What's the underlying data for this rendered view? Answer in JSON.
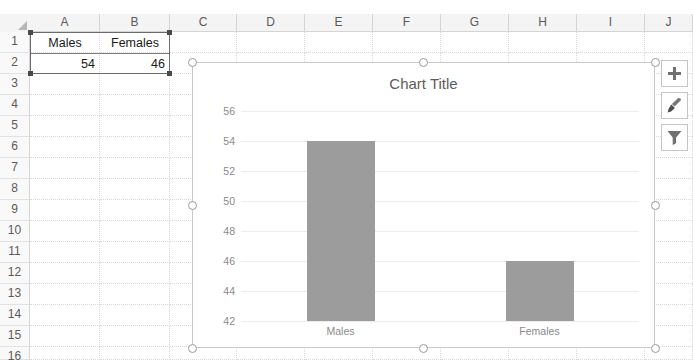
{
  "spreadsheet": {
    "column_headers": [
      "A",
      "B",
      "C",
      "D",
      "E",
      "F",
      "G",
      "H",
      "I",
      "J"
    ],
    "row_headers": [
      "1",
      "2",
      "3",
      "4",
      "5",
      "6",
      "7",
      "8",
      "9",
      "10",
      "11",
      "12",
      "13",
      "14",
      "15",
      "16"
    ],
    "cells": [
      {
        "ref": "A1",
        "value": "Males",
        "align": "center"
      },
      {
        "ref": "B1",
        "value": "Females",
        "align": "center"
      },
      {
        "ref": "A2",
        "value": "54",
        "align": "right"
      },
      {
        "ref": "B2",
        "value": "46",
        "align": "right"
      }
    ],
    "selected_range": "A1:B2"
  },
  "chart": {
    "title": "Chart Title",
    "buttons": [
      {
        "name": "chart-elements-button",
        "icon": "plus-icon",
        "label": "Chart Elements"
      },
      {
        "name": "chart-styles-button",
        "icon": "paintbrush-icon",
        "label": "Chart Styles"
      },
      {
        "name": "chart-filters-button",
        "icon": "funnel-icon",
        "label": "Chart Filters"
      }
    ],
    "series_color": "#9c9c9c",
    "selected": true
  },
  "chart_data": {
    "type": "bar",
    "title": "Chart Title",
    "categories": [
      "Males",
      "Females"
    ],
    "values": [
      54,
      46
    ],
    "series": [
      {
        "name": "Series 1",
        "values": [
          54,
          46
        ]
      }
    ],
    "xlabel": "",
    "ylabel": "",
    "ylim": [
      42,
      56
    ],
    "yticks": [
      42,
      44,
      46,
      48,
      50,
      52,
      54,
      56
    ],
    "ytick_labels": [
      "42",
      "44",
      "46",
      "48",
      "50",
      "52",
      "54",
      "56"
    ],
    "grid": true,
    "legend": false
  }
}
